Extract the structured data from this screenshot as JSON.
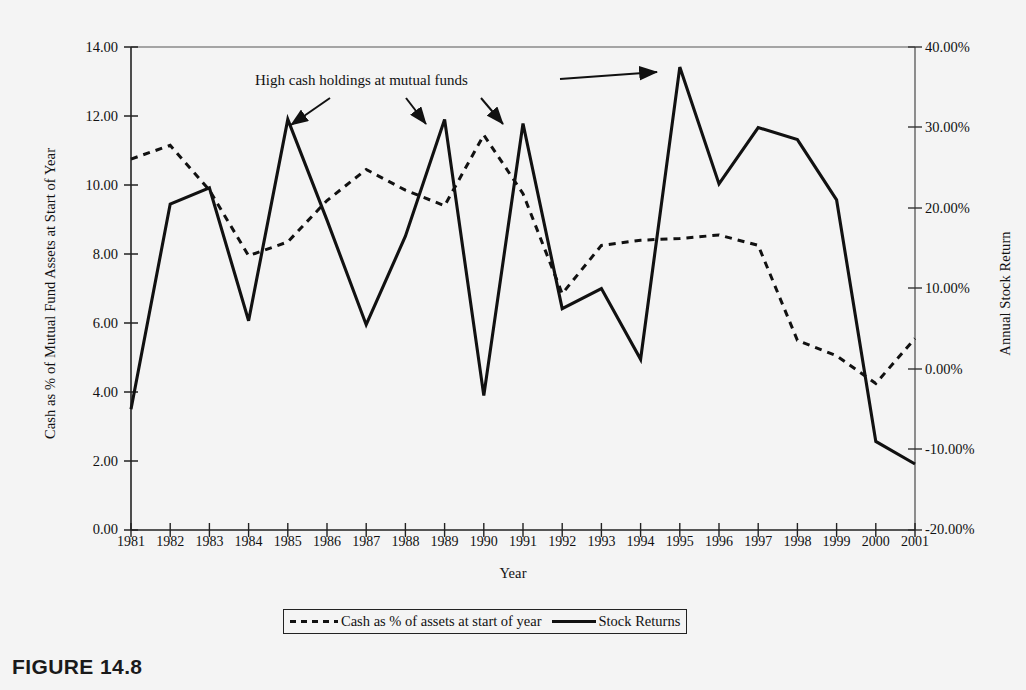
{
  "figure": {
    "caption": "FIGURE 14.8"
  },
  "annotation": {
    "text": "High cash holdings at mutual funds"
  },
  "axes": {
    "y_left_title": "Cash as % of Mutual Fund Assets at Start of Year",
    "y_right_title": "Annual Stock Return",
    "x_title": "Year",
    "y_left_ticks": [
      "14.00",
      "12.00",
      "10.00",
      "8.00",
      "6.00",
      "4.00",
      "2.00",
      "0.00"
    ],
    "y_right_ticks": [
      "40.00%",
      "30.00%",
      "20.00%",
      "10.00%",
      "0.00%",
      "-10.00%",
      "-20.00%"
    ]
  },
  "legend": {
    "items": [
      {
        "label": "Cash as % of assets at start of year",
        "style": "dashed"
      },
      {
        "label": "Stock Returns",
        "style": "solid"
      }
    ]
  },
  "chart_data": {
    "type": "line",
    "title": "FIGURE 14.8",
    "xlabel": "Year",
    "ylabel": "Cash as % of Mutual Fund Assets at Start of Year",
    "y2label": "Annual Stock Return",
    "grid": false,
    "legend_position": "bottom",
    "ylim": [
      0,
      14
    ],
    "y2lim": [
      -20,
      40
    ],
    "yticks": [
      0,
      2,
      4,
      6,
      8,
      10,
      12,
      14
    ],
    "y2ticks": [
      -20,
      -10,
      0,
      10,
      20,
      30,
      40
    ],
    "categories": [
      1981,
      1982,
      1983,
      1984,
      1985,
      1986,
      1987,
      1988,
      1989,
      1990,
      1991,
      1992,
      1993,
      1994,
      1995,
      1996,
      1997,
      1998,
      1999,
      2000,
      2001
    ],
    "series": [
      {
        "name": "Cash as % of assets at start of year",
        "axis": "left",
        "style": "dashed",
        "units": "percent_of_assets",
        "values": [
          10.75,
          11.15,
          9.85,
          7.95,
          8.35,
          9.55,
          10.45,
          9.85,
          9.4,
          11.45,
          9.75,
          6.85,
          8.25,
          8.4,
          8.45,
          8.55,
          8.25,
          5.5,
          5.05,
          4.25,
          5.55
        ]
      },
      {
        "name": "Stock Returns",
        "axis": "right",
        "style": "solid",
        "units": "percent_return",
        "values": [
          -5.0,
          20.5,
          22.5,
          6.0,
          31.0,
          18.5,
          5.5,
          16.5,
          31.0,
          -3.3,
          30.5,
          7.5,
          10.0,
          1.2,
          37.5,
          23.0,
          30.0,
          28.5,
          21.0,
          -9.0,
          -11.8
        ],
        "left_axis_equivalent": [
          3.5,
          9.4,
          9.85,
          6.05,
          11.95,
          9.0,
          5.95,
          8.8,
          11.95,
          3.9,
          11.75,
          6.35,
          6.95,
          4.9,
          13.25,
          10.2,
          12.05,
          11.65,
          9.4,
          2.45,
          1.85
        ]
      }
    ],
    "annotations": [
      {
        "text": "High cash holdings at mutual funds",
        "targets": [
          1985,
          1989,
          1991,
          1995
        ]
      }
    ]
  },
  "colors": {
    "ink": "#111111",
    "background": "#f4f4f4"
  }
}
